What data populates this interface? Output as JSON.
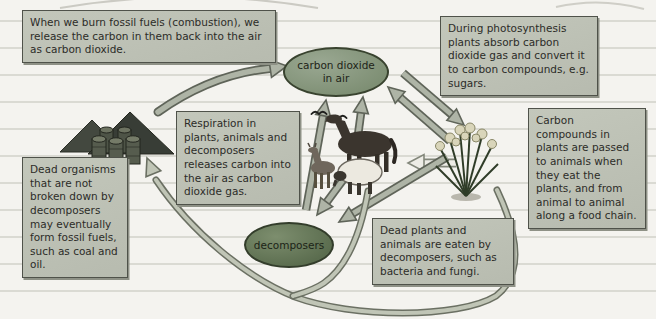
{
  "diagram": {
    "type": "carbon-cycle",
    "nodes": [
      {
        "id": "carbon-dioxide-in-air",
        "label": "carbon dioxide in air"
      },
      {
        "id": "decomposers",
        "label": "decomposers"
      }
    ],
    "boxes": [
      {
        "id": "combustion",
        "text": "When we burn fossil fuels (combustion), we release the carbon in them back into the air as carbon dioxide."
      },
      {
        "id": "photosynthesis",
        "text": "During photosynthesis plants absorb carbon dioxide gas and convert it to carbon compounds, e.g. sugars."
      },
      {
        "id": "food-chain",
        "text": "Carbon compounds in plants are passed to animals when they eat the plants, and from animal to animal along a food chain."
      },
      {
        "id": "respiration",
        "text": "Respiration in plants, animals and decomposers releases carbon into the air as carbon dioxide gas."
      },
      {
        "id": "fossil-fuel-formation",
        "text": "Dead organisms that are not broken down by decomposers may eventually form fossil fuels, such as coal and oil."
      },
      {
        "id": "decomposition",
        "text": "Dead plants and animals are eaten by decomposers, such as bacteria and fungi."
      }
    ],
    "icons": [
      {
        "id": "fossil-fuels-icon",
        "depicts": "coal heaps with oil barrels"
      },
      {
        "id": "animals-icon",
        "depicts": "horse, sheep, goat and flying birds"
      },
      {
        "id": "plant-icon",
        "depicts": "clump of flowering plants"
      }
    ],
    "arrows": [
      {
        "from": "fossil fuels",
        "to": "carbon dioxide in air"
      },
      {
        "from": "decomposers",
        "to": "carbon dioxide in air"
      },
      {
        "from": "animals",
        "to": "carbon dioxide in air"
      },
      {
        "from": "carbon dioxide in air",
        "to": "plants"
      },
      {
        "from": "plants",
        "to": "carbon dioxide in air"
      },
      {
        "from": "plants",
        "to": "animals"
      },
      {
        "from": "animals",
        "to": "decomposers"
      },
      {
        "from": "plants",
        "to": "decomposers"
      },
      {
        "from": "dead plants and animals",
        "to": "fossil fuels"
      }
    ],
    "colors": {
      "paper": "#f4f3ef",
      "rule_line": "#dadad3",
      "box_fill": "#bcc0b4",
      "box_border": "#4f524a",
      "co2_ellipse_fill": "#87987c",
      "decomposers_ellipse_fill": "#66785a",
      "arrow_fill": "#aeb4a6",
      "arrow_outline": "#5f6459",
      "text": "#2c2c28"
    }
  }
}
